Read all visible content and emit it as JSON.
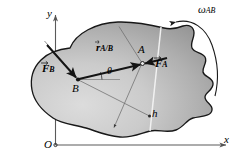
{
  "figure": {
    "axes": {
      "y_label": "y",
      "x_label": "x",
      "origin_label": "O"
    },
    "points": [
      {
        "id": "A",
        "label": "A",
        "x": 142,
        "y": 63
      },
      {
        "id": "B",
        "label": "B",
        "x": 78,
        "y": 79
      }
    ],
    "vectors": [
      {
        "id": "F_A",
        "symbol": "F",
        "subscript": "A",
        "label": "F_A",
        "applied_at": "A",
        "direction": "down-left-to-A"
      },
      {
        "id": "F_B",
        "symbol": "F",
        "subscript": "B",
        "label": "F_B",
        "applied_at": "B",
        "direction": "down-right-to-B"
      },
      {
        "id": "r_A/B",
        "symbol": "r",
        "subscript": "A/B",
        "label": "r_A/B",
        "from": "B",
        "to": "A"
      }
    ],
    "angles": [
      {
        "id": "theta",
        "label": "θ",
        "between": "r_A/B and horizontal reference at B"
      }
    ],
    "distances": [
      {
        "id": "h",
        "label": "h",
        "description": "perpendicular moment arm"
      }
    ],
    "rotation": {
      "label": "ω",
      "subscript": "AB",
      "full_label": "ω_AB",
      "sense": "counterclockwise"
    },
    "colors": {
      "body_fill_light": "#d2d2d2",
      "body_fill_mid": "#b8b8b8",
      "body_fill_dark": "#949494",
      "outline": "#1a1a1a",
      "axis": "#555555",
      "vector": "#141414",
      "thin_line": "#6a6a6a",
      "action_line_light": "#f2f2f2",
      "background": "#ffffff"
    }
  }
}
